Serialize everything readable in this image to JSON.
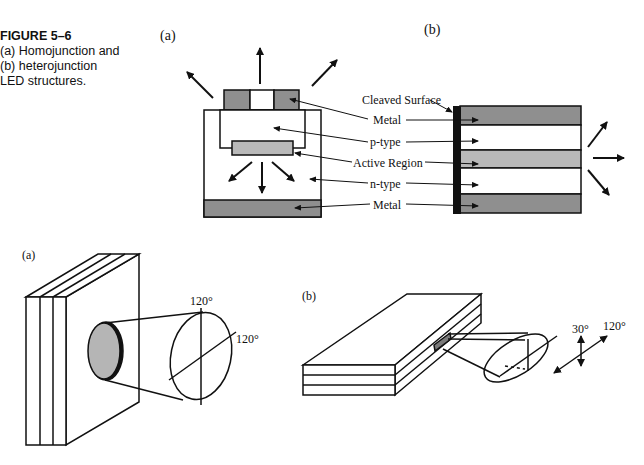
{
  "caption": {
    "figure_label": "FIGURE 5–6",
    "lines": [
      "(a) Homojunction and",
      "(b) heterojunction",
      "LED structures."
    ]
  },
  "top_diagram_a": {
    "panel_label": "(a)"
  },
  "top_diagram_b": {
    "panel_label": "(b)",
    "labels": {
      "cleaved_surface": "Cleaved Surface",
      "metal_top": "Metal",
      "p_type": "p-type",
      "active_region": "Active Region",
      "n_type": "n-type",
      "metal_bottom": "Metal"
    }
  },
  "bottom_diagram_a": {
    "panel_label": "(a)",
    "angle_vertical": "120°",
    "angle_diagonal": "120°"
  },
  "bottom_diagram_b": {
    "panel_label": "(b)",
    "angle_vertical": "30°",
    "angle_diagonal": "120°"
  },
  "colors": {
    "metal": "#8f8f8f",
    "active": "#b9b9b9",
    "cleaved": "#111111",
    "line": "#111111"
  }
}
